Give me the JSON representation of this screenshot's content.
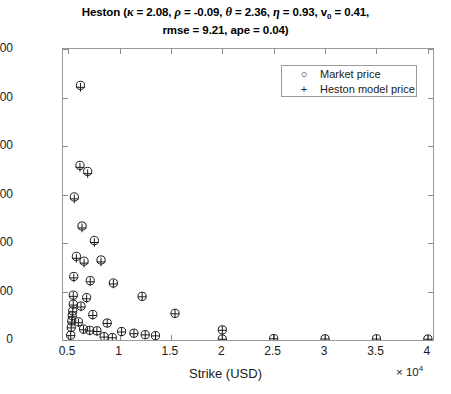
{
  "title": {
    "line1_prefix": "Heston (",
    "kappa": "κ = 2.08,",
    "rho": "ρ = -0.09,",
    "theta": "θ = 2.36,",
    "eta": "η = 0.93,",
    "v0_sym": "v",
    "v0_sub": "0",
    "v0_val": "= 0.41,",
    "line2": "rmse = 9.21, ape = 0.04)",
    "full": "Heston (κ = 2.08, ρ = -0.09, θ = 2.36, η = 0.93, v0 = 0.41, rmse = 9.21, ape = 0.04)"
  },
  "legend": {
    "position": "top-right",
    "entries": [
      {
        "marker": "○",
        "label": "Market price",
        "marker_name": "circle-marker"
      },
      {
        "marker": "+",
        "label": "Heston model price",
        "marker_name": "plus-marker"
      }
    ]
  },
  "axes": {
    "x_title": "Strike (USD)",
    "y_title": "Price (USD)",
    "x_exponent_prefix": "× 10",
    "x_exponent_power": "4",
    "x_ticks": [
      "0.5",
      "1",
      "1.5",
      "2",
      "2.5",
      "3",
      "3.5",
      "4"
    ],
    "y_ticks": [
      "0",
      "200",
      "400",
      "600",
      "800",
      "1000",
      "1200"
    ]
  },
  "chart_data": {
    "type": "scatter",
    "title": "Heston (κ = 2.08, ρ = -0.09, θ = 2.36, η = 0.93, v0 = 0.41, rmse = 9.21, ape = 0.04)",
    "xlabel": "Strike (USD)",
    "ylabel": "Price (USD)",
    "x_scale_factor": 10000,
    "xlim": [
      4500,
      40500
    ],
    "ylim": [
      0,
      1200
    ],
    "grid": false,
    "legend_position": "upper right",
    "series": [
      {
        "name": "Market price",
        "marker": "o",
        "color": "#1a1a1a",
        "points": [
          [
            6200,
            1050
          ],
          [
            6150,
            720
          ],
          [
            6900,
            695
          ],
          [
            5600,
            590
          ],
          [
            6350,
            470
          ],
          [
            7550,
            410
          ],
          [
            5800,
            345
          ],
          [
            6550,
            325
          ],
          [
            8200,
            330
          ],
          [
            5550,
            262
          ],
          [
            7150,
            245
          ],
          [
            9400,
            235
          ],
          [
            5500,
            185
          ],
          [
            6800,
            175
          ],
          [
            12200,
            180
          ],
          [
            5500,
            148
          ],
          [
            6250,
            140
          ],
          [
            5450,
            120
          ],
          [
            5400,
            100
          ],
          [
            7400,
            105
          ],
          [
            5350,
            78
          ],
          [
            6000,
            75
          ],
          [
            8800,
            70
          ],
          [
            15400,
            110
          ],
          [
            5300,
            52
          ],
          [
            6500,
            45
          ],
          [
            7100,
            40
          ],
          [
            7800,
            38
          ],
          [
            10200,
            35
          ],
          [
            11400,
            28
          ],
          [
            12500,
            22
          ],
          [
            13500,
            18
          ],
          [
            20000,
            42
          ],
          [
            5250,
            20
          ],
          [
            8500,
            14
          ],
          [
            9300,
            10
          ],
          [
            20000,
            4
          ],
          [
            25000,
            6
          ],
          [
            30000,
            5
          ],
          [
            35000,
            5
          ],
          [
            40000,
            4
          ]
        ]
      },
      {
        "name": "Heston model price",
        "marker": "+",
        "color": "#1a1a1a",
        "points": [
          [
            6200,
            1042
          ],
          [
            6150,
            712
          ],
          [
            6900,
            686
          ],
          [
            5600,
            582
          ],
          [
            6350,
            462
          ],
          [
            7550,
            402
          ],
          [
            5800,
            337
          ],
          [
            6550,
            317
          ],
          [
            8200,
            322
          ],
          [
            5550,
            256
          ],
          [
            7150,
            240
          ],
          [
            9400,
            231
          ],
          [
            5500,
            180
          ],
          [
            6800,
            170
          ],
          [
            12200,
            178
          ],
          [
            5500,
            144
          ],
          [
            6250,
            136
          ],
          [
            5450,
            116
          ],
          [
            5400,
            96
          ],
          [
            7400,
            101
          ],
          [
            5350,
            74
          ],
          [
            6000,
            71
          ],
          [
            8800,
            68
          ],
          [
            15400,
            108
          ],
          [
            5300,
            50
          ],
          [
            6500,
            42
          ],
          [
            7100,
            37
          ],
          [
            7800,
            35
          ],
          [
            10200,
            33
          ],
          [
            11400,
            26
          ],
          [
            12500,
            21
          ],
          [
            13500,
            17
          ],
          [
            20000,
            40
          ],
          [
            5250,
            18
          ],
          [
            8500,
            12
          ],
          [
            9300,
            9
          ],
          [
            20000,
            3
          ],
          [
            25000,
            5
          ],
          [
            30000,
            4
          ],
          [
            35000,
            4
          ],
          [
            40000,
            3
          ]
        ]
      }
    ]
  }
}
